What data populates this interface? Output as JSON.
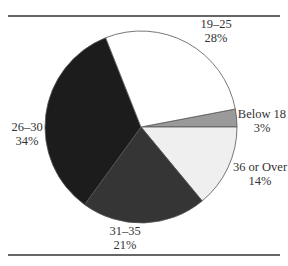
{
  "chart_data": {
    "type": "pie",
    "title": "",
    "categories": [
      "Below 18",
      "19–25",
      "26–30",
      "31–35",
      "36 or Over"
    ],
    "values": [
      3,
      28,
      34,
      21,
      14
    ],
    "unit": "%",
    "colors": [
      "#9a9a9a",
      "#ffffff",
      "#1c1c1c",
      "#353535",
      "#efefef"
    ],
    "labels": [
      {
        "name": "Below 18",
        "pct": "3%"
      },
      {
        "name": "19–25",
        "pct": "28%"
      },
      {
        "name": "26–30",
        "pct": "34%"
      },
      {
        "name": "31–35",
        "pct": "21%"
      },
      {
        "name": "36 or Over",
        "pct": "14%"
      }
    ],
    "legend": "none (direct labels)"
  }
}
